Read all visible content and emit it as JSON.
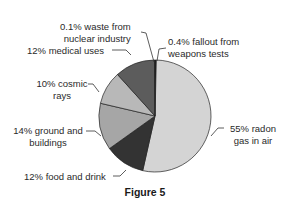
{
  "chart_data": {
    "type": "pie",
    "title": "Figure 5",
    "unit": "%",
    "start_angle_deg": 0,
    "direction": "clockwise",
    "slices": [
      {
        "label": "fallout from weapons tests",
        "value": 0.4,
        "color": "#1a1a1a"
      },
      {
        "label": "radon gas in air",
        "value": 55,
        "color": "#d4d4d4"
      },
      {
        "label": "food and drink",
        "value": 12,
        "color": "#333333"
      },
      {
        "label": "ground and buildings",
        "value": 14,
        "color": "#a6a6a6"
      },
      {
        "label": "cosmic rays",
        "value": 10,
        "color": "#b8b8b8"
      },
      {
        "label": "medical uses",
        "value": 12,
        "color": "#5c5c5c"
      },
      {
        "label": "waste from nuclear industry",
        "value": 0.1,
        "color": "#111111"
      }
    ]
  },
  "labels": {
    "waste_l1": "0.1% waste from",
    "waste_l2": "nuclear industry",
    "medical": "12% medical uses",
    "cosmic_l1": "10% cosmic",
    "cosmic_l2": "rays",
    "ground_l1": "14% ground and",
    "ground_l2": "buildings",
    "food": "12% food and drink",
    "fallout_l1": "0.4% fallout from",
    "fallout_l2": "weapons tests",
    "radon_l1": "55% radon",
    "radon_l2": "gas in air"
  },
  "caption": "Figure 5"
}
